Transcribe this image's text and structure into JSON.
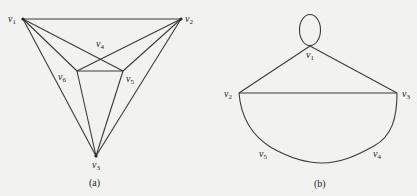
{
  "figure_a": {
    "caption": "(a)",
    "vertices": [
      {
        "id": "v1",
        "label": "v",
        "sub": "1"
      },
      {
        "id": "v2",
        "label": "v",
        "sub": "2"
      },
      {
        "id": "v3",
        "label": "v",
        "sub": "3"
      },
      {
        "id": "v4",
        "label": "v",
        "sub": "4"
      },
      {
        "id": "v5",
        "label": "v",
        "sub": "5"
      },
      {
        "id": "v6",
        "label": "v",
        "sub": "6"
      }
    ],
    "edges": [
      [
        "v1",
        "v2"
      ],
      [
        "v1",
        "v3"
      ],
      [
        "v2",
        "v3"
      ],
      [
        "v1",
        "v6"
      ],
      [
        "v1",
        "v5"
      ],
      [
        "v2",
        "v6"
      ],
      [
        "v2",
        "v5"
      ],
      [
        "v6",
        "v5"
      ],
      [
        "v6",
        "v3"
      ],
      [
        "v5",
        "v3"
      ]
    ]
  },
  "figure_b": {
    "caption": "(b)",
    "vertices": [
      {
        "id": "v1",
        "label": "v",
        "sub": "1"
      },
      {
        "id": "v2",
        "label": "v",
        "sub": "2"
      },
      {
        "id": "v3",
        "label": "v",
        "sub": "3"
      },
      {
        "id": "v4",
        "label": "v",
        "sub": "4"
      },
      {
        "id": "v5",
        "label": "v",
        "sub": "5"
      }
    ],
    "edges": [
      [
        "v1",
        "v1",
        "loop"
      ],
      [
        "v1",
        "v2"
      ],
      [
        "v1",
        "v3"
      ],
      [
        "v2",
        "v3"
      ],
      [
        "v2",
        "v5",
        "curve"
      ],
      [
        "v5",
        "v4",
        "curve"
      ],
      [
        "v4",
        "v3",
        "curve"
      ]
    ]
  },
  "colors": {
    "background": "#f2f2f0",
    "stroke": "#3a3a3a",
    "text": "#222222"
  }
}
